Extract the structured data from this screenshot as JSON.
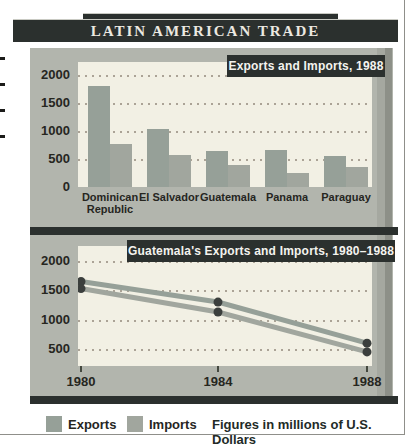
{
  "page_title": "LATIN AMERICAN TRADE",
  "legend": {
    "exports_label": "Exports",
    "imports_label": "Imports",
    "note": "Figures in millions of U.S. Dollars"
  },
  "colors": {
    "dark_band": "#2b302e",
    "panel_bg": "#b2b5ad",
    "plot_bg": "#f2f0e4",
    "exports": "#96a098",
    "imports": "#a1a69e",
    "grid_dot": "#aba396",
    "point_dot": "#3b3f3d",
    "axis_text": "#26261f"
  },
  "chart_data": [
    {
      "type": "bar",
      "title": "Exports and Imports, 1988",
      "categories": [
        "Dominican Republic",
        "El Salvador",
        "Guatemala",
        "Panama",
        "Paraguay"
      ],
      "series": [
        {
          "name": "Exports",
          "values": [
            1800,
            1030,
            640,
            660,
            550
          ]
        },
        {
          "name": "Imports",
          "values": [
            770,
            580,
            400,
            250,
            350
          ]
        }
      ],
      "yticks": [
        2000,
        1500,
        1000,
        500,
        0
      ],
      "ylim": [
        0,
        2230
      ],
      "grid": "dotted",
      "units": "millions of U.S. Dollars"
    },
    {
      "type": "line",
      "title": "Guatemala's Exports and Imports, 1980–1988",
      "x": [
        1980,
        1984,
        1988
      ],
      "series": [
        {
          "name": "Exports",
          "values": [
            1650,
            1300,
            600
          ]
        },
        {
          "name": "Imports",
          "values": [
            1530,
            1130,
            450
          ]
        }
      ],
      "yticks": [
        2000,
        1500,
        1000,
        500
      ],
      "ylim": [
        250,
        2250
      ],
      "grid": "dotted",
      "units": "millions of U.S. Dollars"
    }
  ]
}
